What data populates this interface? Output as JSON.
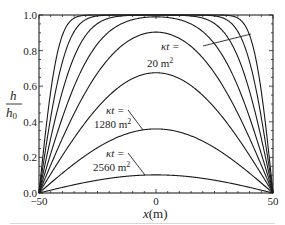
{
  "chart_data": {
    "type": "line",
    "title": "",
    "xlabel": "x(m)",
    "ylabel_num": "h",
    "ylabel_den": "h0",
    "xlim": [
      -50,
      50
    ],
    "ylim": [
      0,
      1.0
    ],
    "xticks": [
      -50,
      0,
      50
    ],
    "xtick_labels": [
      "−50",
      "0",
      "50"
    ],
    "yticks": [
      0.0,
      0.2,
      0.4,
      0.6,
      0.8,
      1.0
    ],
    "ytick_labels": [
      "0.0",
      "0.2",
      "0.4",
      "0.6",
      "0.8",
      "1.0"
    ],
    "grid": false,
    "legend": "none",
    "series": [
      {
        "name": "κt = 20 m²",
        "kt": 20,
        "peak": 1.0
      },
      {
        "name": "κt = 40 m²",
        "kt": 40,
        "peak": 1.0
      },
      {
        "name": "κt = 80 m²",
        "kt": 80,
        "peak": 1.0
      },
      {
        "name": "κt = 160 m²",
        "kt": 160,
        "peak": 0.99
      },
      {
        "name": "κt = 320 m²",
        "kt": 320,
        "peak": 0.91
      },
      {
        "name": "κt = 640 m²",
        "kt": 640,
        "peak": 0.68
      },
      {
        "name": "κt = 1280 m²",
        "kt": 1280,
        "peak": 0.36
      },
      {
        "name": "κt = 2560 m²",
        "kt": 2560,
        "peak": 0.1
      }
    ],
    "annotations": [
      {
        "line1": "κt =",
        "line2": "20 m²",
        "target_series": "κt = 20 m²"
      },
      {
        "line1": "κt =",
        "line2": "1280 m²",
        "target_series": "κt = 1280 m²"
      },
      {
        "line1": "κt =",
        "line2": "2560 m²",
        "target_series": "κt = 2560 m²"
      }
    ]
  },
  "labels": {
    "ann1_l1": "κt =",
    "ann1_l2": "20 m",
    "ann2_l1": "κt =",
    "ann2_l2": "1280 m",
    "ann3_l1": "κt =",
    "ann3_l2": "2560 m",
    "sup": "2",
    "xlabel_x": "x",
    "xlabel_unit": "(m)",
    "ylabel_num": "h",
    "ylabel_den": "h",
    "ylabel_sub": "0"
  }
}
